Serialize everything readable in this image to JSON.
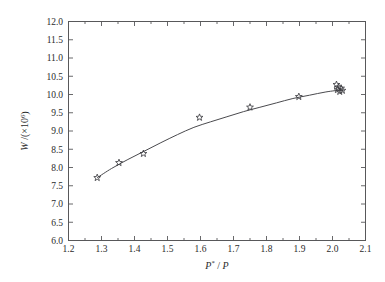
{
  "chart_data": {
    "type": "scatter",
    "title": "",
    "xlabel": "P*/P",
    "ylabel": "W/(×10⁶)",
    "xlabel_parts": {
      "base": "P",
      "superscript": "*",
      "divider": "/",
      "denominator": "P"
    },
    "ylabel_parts": {
      "base": "W",
      "divider": "/",
      "open": "(×10",
      "superscript": "6",
      "close": ")"
    },
    "xlim": [
      1.2,
      2.1
    ],
    "ylim": [
      6.0,
      12.0
    ],
    "xticks": [
      1.2,
      1.3,
      1.4,
      1.5,
      1.6,
      1.7,
      1.8,
      1.9,
      2.0,
      2.1
    ],
    "yticks": [
      6.0,
      6.5,
      7.0,
      7.5,
      8.0,
      8.5,
      9.0,
      9.5,
      10.0,
      10.5,
      11.0,
      11.5,
      12.0
    ],
    "xtick_labels": [
      "1.2",
      "1.3",
      "1.4",
      "1.5",
      "1.6",
      "1.7",
      "1.8",
      "1.9",
      "2.0",
      "2.1"
    ],
    "ytick_labels": [
      "6.0",
      "6.5",
      "7.0",
      "7.5",
      "8.0",
      "8.5",
      "9.0",
      "9.5",
      "10.0",
      "10.5",
      "11.0",
      "11.5",
      "12.0"
    ],
    "grid": false,
    "legend": null,
    "marker": "star",
    "marker_color": "#3d3d42",
    "line_color": "#4a4a4e",
    "points": [
      {
        "x": 1.287,
        "y": 7.72
      },
      {
        "x": 1.353,
        "y": 8.13
      },
      {
        "x": 1.427,
        "y": 8.38
      },
      {
        "x": 1.597,
        "y": 9.37
      },
      {
        "x": 1.75,
        "y": 9.65
      },
      {
        "x": 1.898,
        "y": 9.94
      },
      {
        "x": 2.012,
        "y": 10.27
      },
      {
        "x": 2.018,
        "y": 10.2
      },
      {
        "x": 2.015,
        "y": 10.13
      },
      {
        "x": 2.022,
        "y": 10.08
      },
      {
        "x": 2.03,
        "y": 10.11
      },
      {
        "x": 2.026,
        "y": 10.17
      }
    ],
    "fit_curve": [
      {
        "x": 1.287,
        "y": 7.72
      },
      {
        "x": 1.33,
        "y": 7.97
      },
      {
        "x": 1.38,
        "y": 8.22
      },
      {
        "x": 1.43,
        "y": 8.45
      },
      {
        "x": 1.48,
        "y": 8.68
      },
      {
        "x": 1.53,
        "y": 8.9
      },
      {
        "x": 1.58,
        "y": 9.1
      },
      {
        "x": 1.63,
        "y": 9.25
      },
      {
        "x": 1.68,
        "y": 9.39
      },
      {
        "x": 1.73,
        "y": 9.53
      },
      {
        "x": 1.78,
        "y": 9.65
      },
      {
        "x": 1.83,
        "y": 9.77
      },
      {
        "x": 1.88,
        "y": 9.89
      },
      {
        "x": 1.93,
        "y": 9.98
      },
      {
        "x": 1.98,
        "y": 10.07
      },
      {
        "x": 2.03,
        "y": 10.13
      }
    ]
  }
}
